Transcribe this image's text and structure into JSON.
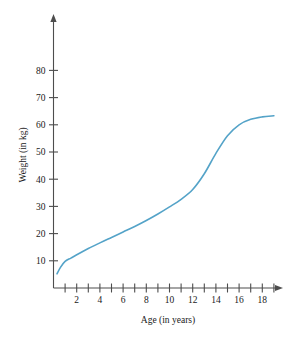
{
  "chart_data": {
    "type": "line",
    "title": "",
    "subtitle": "",
    "xlabel": "Age (in years)",
    "ylabel": "Weight (in kg)",
    "xlim": [
      0,
      19.6
    ],
    "ylim": [
      0,
      84
    ],
    "grid": false,
    "legend": null,
    "series_color": "#54a3c8",
    "axis_color": "#4d4d4d",
    "x_ticks_major": [
      2,
      4,
      6,
      8,
      10,
      12,
      14,
      16,
      18
    ],
    "x_ticks_all": [
      1,
      2,
      3,
      4,
      5,
      6,
      7,
      8,
      9,
      10,
      11,
      12,
      13,
      14,
      15,
      16,
      17,
      18,
      19
    ],
    "x_tick_labels": [
      "2",
      "4",
      "6",
      "8",
      "10",
      "12",
      "14",
      "16",
      "18"
    ],
    "y_ticks": [
      10,
      20,
      30,
      40,
      50,
      60,
      70,
      80
    ],
    "y_tick_labels": [
      "10",
      "20",
      "30",
      "40",
      "50",
      "60",
      "70",
      "80"
    ],
    "series": [
      {
        "name": "Weight",
        "x": [
          0.3,
          0.6,
          1.0,
          1.5,
          2.0,
          3.0,
          4.0,
          5.0,
          6.0,
          7.0,
          8.0,
          9.0,
          10.0,
          11.0,
          12.0,
          13.0,
          14.0,
          15.0,
          16.0,
          17.0,
          18.0,
          19.0
        ],
        "values": [
          5.2,
          7.6,
          9.8,
          11.0,
          12.2,
          14.5,
          16.6,
          18.6,
          20.6,
          22.6,
          24.8,
          27.2,
          29.8,
          32.6,
          36.2,
          42.0,
          49.5,
          56.0,
          60.0,
          62.0,
          62.9,
          63.3
        ]
      }
    ]
  },
  "figure": {
    "x_axis_name": "horizontal-axis",
    "y_axis_name": "vertical-axis"
  }
}
